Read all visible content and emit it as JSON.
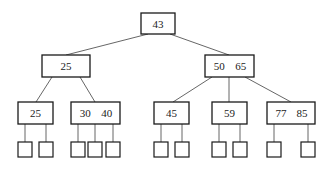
{
  "colors": {
    "line": "#555555",
    "border": "#1a1a1a",
    "text": "#222222",
    "background": "#ffffff"
  },
  "nodes": [
    {
      "id": "root",
      "keys": [
        "43"
      ],
      "x": 141,
      "y": 13,
      "w": 34,
      "h": 21
    },
    {
      "id": "n25",
      "keys": [
        "25"
      ],
      "x": 42,
      "y": 55,
      "w": 48,
      "h": 22
    },
    {
      "id": "n50_65",
      "keys": [
        "50",
        "65"
      ],
      "x": 205,
      "y": 55,
      "w": 49,
      "h": 22
    },
    {
      "id": "n25b",
      "keys": [
        "25"
      ],
      "x": 18,
      "y": 102,
      "w": 35,
      "h": 22
    },
    {
      "id": "n30_40",
      "keys": [
        "30",
        "40"
      ],
      "x": 71,
      "y": 102,
      "w": 49,
      "h": 22
    },
    {
      "id": "n45",
      "keys": [
        "45"
      ],
      "x": 154,
      "y": 102,
      "w": 35,
      "h": 22
    },
    {
      "id": "n59",
      "keys": [
        "59"
      ],
      "x": 212,
      "y": 102,
      "w": 35,
      "h": 22
    },
    {
      "id": "n77_85",
      "keys": [
        "77",
        "85"
      ],
      "x": 267,
      "y": 102,
      "w": 48,
      "h": 22
    }
  ],
  "edges": [
    {
      "x1": 148,
      "y1": 34,
      "x2": 66,
      "y2": 55
    },
    {
      "x1": 170,
      "y1": 34,
      "x2": 229,
      "y2": 55
    },
    {
      "x1": 52,
      "y1": 77,
      "x2": 36,
      "y2": 102
    },
    {
      "x1": 80,
      "y1": 77,
      "x2": 95,
      "y2": 102
    },
    {
      "x1": 212,
      "y1": 77,
      "x2": 173,
      "y2": 102
    },
    {
      "x1": 229,
      "y1": 77,
      "x2": 229,
      "y2": 102
    },
    {
      "x1": 245,
      "y1": 77,
      "x2": 291,
      "y2": 102
    },
    {
      "x1": 25,
      "y1": 124,
      "x2": 25,
      "y2": 142
    },
    {
      "x1": 46,
      "y1": 124,
      "x2": 46,
      "y2": 142
    },
    {
      "x1": 78,
      "y1": 124,
      "x2": 78,
      "y2": 142
    },
    {
      "x1": 95,
      "y1": 124,
      "x2": 95,
      "y2": 142
    },
    {
      "x1": 113,
      "y1": 124,
      "x2": 113,
      "y2": 142
    },
    {
      "x1": 161,
      "y1": 124,
      "x2": 161,
      "y2": 142
    },
    {
      "x1": 182,
      "y1": 124,
      "x2": 182,
      "y2": 142
    },
    {
      "x1": 219,
      "y1": 124,
      "x2": 219,
      "y2": 142
    },
    {
      "x1": 240,
      "y1": 124,
      "x2": 240,
      "y2": 142
    },
    {
      "x1": 274,
      "y1": 124,
      "x2": 274,
      "y2": 142
    },
    {
      "x1": 308,
      "y1": 124,
      "x2": 308,
      "y2": 142
    }
  ],
  "leaves": [
    {
      "x": 18,
      "y": 142,
      "w": 14,
      "h": 15
    },
    {
      "x": 39,
      "y": 142,
      "w": 14,
      "h": 15
    },
    {
      "x": 71,
      "y": 142,
      "w": 14,
      "h": 15
    },
    {
      "x": 88,
      "y": 142,
      "w": 14,
      "h": 15
    },
    {
      "x": 106,
      "y": 142,
      "w": 14,
      "h": 15
    },
    {
      "x": 154,
      "y": 142,
      "w": 14,
      "h": 15
    },
    {
      "x": 175,
      "y": 142,
      "w": 14,
      "h": 15
    },
    {
      "x": 212,
      "y": 142,
      "w": 14,
      "h": 15
    },
    {
      "x": 233,
      "y": 142,
      "w": 14,
      "h": 15
    },
    {
      "x": 267,
      "y": 142,
      "w": 14,
      "h": 15
    },
    {
      "x": 301,
      "y": 142,
      "w": 14,
      "h": 15
    }
  ]
}
